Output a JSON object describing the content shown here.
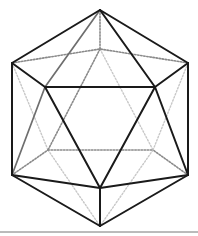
{
  "diagram": {
    "type": "wireframe-polyhedron",
    "shape": "icosahedron",
    "colors": {
      "front_edge": "#1a1a1a",
      "mid_edge": "#6e6e6e",
      "hidden_edge": "#8a8a8a",
      "hidden_faint": "#c8c8c8",
      "baseline": "#777777",
      "background": "#ffffff"
    },
    "vertices": {
      "T": [
        100,
        10
      ],
      "UL": [
        12,
        63
      ],
      "UR": [
        188,
        63
      ],
      "BT": [
        100,
        49
      ],
      "FL": [
        45,
        87
      ],
      "FR": [
        155,
        87
      ],
      "LL": [
        12,
        175
      ],
      "LR": [
        188,
        175
      ],
      "BLL": [
        48,
        150
      ],
      "BLR": [
        153,
        150
      ],
      "FB": [
        100,
        188
      ],
      "B": [
        100,
        226
      ]
    },
    "edges_solid": [
      [
        "T",
        "UL"
      ],
      [
        "T",
        "UR"
      ],
      [
        "T",
        "FR"
      ],
      [
        "UL",
        "FL"
      ],
      [
        "UR",
        "FR"
      ],
      [
        "FL",
        "FR"
      ],
      [
        "UL",
        "LL"
      ],
      [
        "UR",
        "LR"
      ],
      [
        "FL",
        "FB"
      ],
      [
        "FR",
        "FB"
      ],
      [
        "FR",
        "LR"
      ],
      [
        "LL",
        "FB"
      ],
      [
        "LR",
        "FB"
      ],
      [
        "FB",
        "B"
      ],
      [
        "LL",
        "B"
      ],
      [
        "LR",
        "B"
      ]
    ],
    "edges_mid": [
      [
        "T",
        "FL"
      ],
      [
        "FL",
        "LL"
      ]
    ],
    "edges_dotted": [
      [
        "T",
        "BT"
      ],
      [
        "UL",
        "BT"
      ],
      [
        "UR",
        "BT"
      ],
      [
        "BLL",
        "BLR"
      ],
      [
        "LL",
        "BLL"
      ],
      [
        "LR",
        "BLR"
      ],
      [
        "BT",
        "BLL"
      ]
    ],
    "edges_faint_dotted": [
      [
        "UL",
        "BLL"
      ],
      [
        "UR",
        "BLR"
      ],
      [
        "BT",
        "BLR"
      ],
      [
        "BLL",
        "B"
      ],
      [
        "BLR",
        "B"
      ]
    ],
    "baseline_y": 232
  }
}
